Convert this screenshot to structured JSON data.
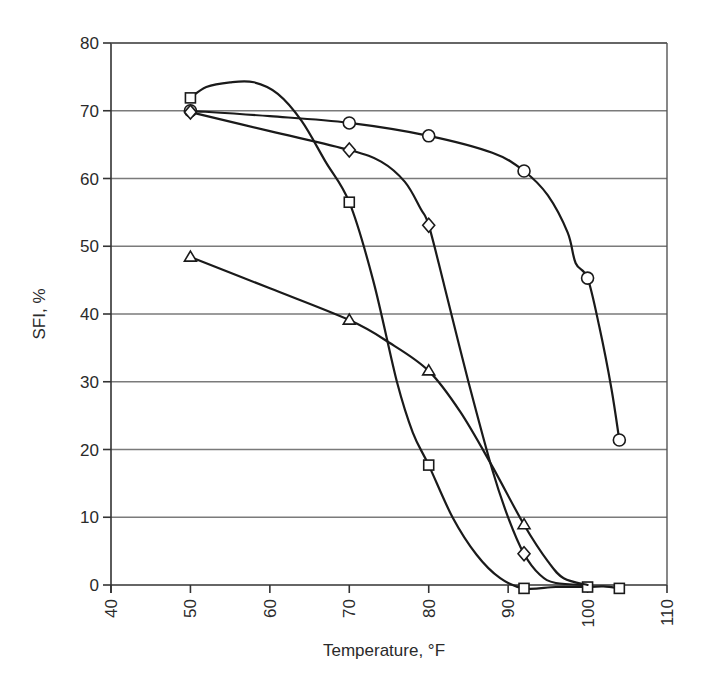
{
  "chart_data": {
    "type": "line",
    "title": "",
    "xlabel": "Temperature, °F",
    "ylabel": "SFI, %",
    "xlim": [
      40,
      110
    ],
    "ylim": [
      0,
      80
    ],
    "x_ticks": [
      40,
      50,
      60,
      70,
      80,
      90,
      100,
      110
    ],
    "y_ticks": [
      0,
      10,
      20,
      30,
      40,
      50,
      60,
      70,
      80
    ],
    "grid": {
      "horizontal": true,
      "vertical": false
    },
    "legend": null,
    "series": [
      {
        "name": "circle",
        "marker": "circle",
        "x": [
          50,
          70,
          80,
          92,
          100,
          104
        ],
        "values": [
          70.0,
          68.2,
          66.3,
          61.1,
          45.3,
          21.4
        ],
        "curve": [
          [
            50,
            70.0
          ],
          [
            60,
            69.2
          ],
          [
            70,
            68.2
          ],
          [
            80,
            66.3
          ],
          [
            88,
            63.8
          ],
          [
            92,
            61.1
          ],
          [
            95,
            57.5
          ],
          [
            97.5,
            52.0
          ],
          [
            98.5,
            47.5
          ],
          [
            100,
            45.3
          ],
          [
            101.5,
            38
          ],
          [
            103,
            29
          ],
          [
            104,
            21.4
          ]
        ]
      },
      {
        "name": "diamond",
        "marker": "diamond",
        "x": [
          50,
          70,
          80,
          92
        ],
        "values": [
          69.8,
          64.2,
          53.1,
          4.6
        ],
        "curve": [
          [
            50,
            69.8
          ],
          [
            60,
            67.0
          ],
          [
            70,
            64.2
          ],
          [
            74,
            62.5
          ],
          [
            77,
            59.5
          ],
          [
            79,
            55.5
          ],
          [
            80,
            53.1
          ],
          [
            82,
            44
          ],
          [
            85,
            30
          ],
          [
            88,
            17
          ],
          [
            90,
            10
          ],
          [
            92,
            4.6
          ],
          [
            94,
            1.5
          ],
          [
            96,
            0.3
          ],
          [
            100,
            0
          ]
        ]
      },
      {
        "name": "square",
        "marker": "square",
        "x": [
          50,
          70,
          80,
          92,
          100,
          104
        ],
        "values": [
          71.9,
          56.5,
          17.7,
          -0.5,
          -0.3,
          -0.5
        ],
        "curve": [
          [
            50,
            71.9
          ],
          [
            52,
            73.5
          ],
          [
            55,
            74.2
          ],
          [
            58,
            74.2
          ],
          [
            61,
            72.5
          ],
          [
            64,
            68.5
          ],
          [
            67,
            62.5
          ],
          [
            70,
            56.5
          ],
          [
            73,
            45
          ],
          [
            76,
            30
          ],
          [
            78,
            22.5
          ],
          [
            80,
            17.7
          ],
          [
            83,
            10
          ],
          [
            86,
            4.5
          ],
          [
            89,
            1.0
          ],
          [
            92,
            -0.5
          ],
          [
            96,
            -0.3
          ],
          [
            100,
            -0.3
          ],
          [
            102,
            -0.2
          ],
          [
            104,
            -0.5
          ]
        ]
      },
      {
        "name": "triangle",
        "marker": "triangle",
        "x": [
          50,
          70,
          80,
          92
        ],
        "values": [
          48.4,
          39.1,
          31.6,
          8.9
        ],
        "curve": [
          [
            50,
            48.4
          ],
          [
            60,
            43.8
          ],
          [
            70,
            39.1
          ],
          [
            75,
            35.8
          ],
          [
            80,
            31.6
          ],
          [
            84,
            25.5
          ],
          [
            88,
            17.5
          ],
          [
            92,
            8.9
          ],
          [
            95,
            3.5
          ],
          [
            97,
            1.0
          ],
          [
            100,
            0
          ]
        ]
      }
    ]
  },
  "axes": {
    "x_title": "Temperature, °F",
    "y_title": "SFI, %"
  }
}
